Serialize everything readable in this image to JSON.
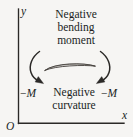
{
  "figure": {
    "background_color": "#f6f5f3",
    "ink_color": "#201e1d",
    "width": 133,
    "height": 137,
    "axes": {
      "y_axis_label": "y",
      "x_axis_label": "x",
      "origin_label": "O"
    },
    "top_caption": {
      "lines": [
        "Negative",
        "bending",
        "moment"
      ]
    },
    "bottom_caption": {
      "lines": [
        "Negative",
        "curvature"
      ]
    },
    "moment_labels": {
      "left": {
        "sign": "−",
        "symbol": "M"
      },
      "right": {
        "sign": "−",
        "symbol": "M"
      }
    },
    "beam": {
      "description": "curved-beam-segment"
    },
    "arrows": {
      "left": "curved-moment-arrow-left",
      "right": "curved-moment-arrow-right"
    }
  }
}
